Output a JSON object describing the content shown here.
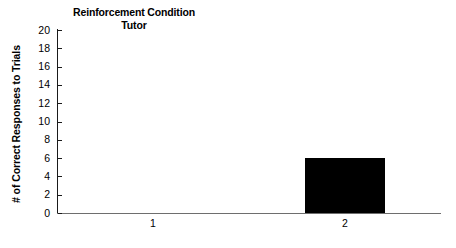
{
  "chart_data": {
    "type": "bar",
    "title": "Reinforcement Condition Tutor",
    "title_lines": [
      "Reinforcement Condition",
      "Tutor"
    ],
    "xlabel": "",
    "ylabel": "# of Correct Responses to Trials",
    "categories": [
      "1",
      "2"
    ],
    "values": [
      0,
      6
    ],
    "series": [
      {
        "name": "Tutor",
        "values": [
          0,
          6
        ]
      }
    ],
    "ylim": [
      0,
      20
    ],
    "ytick_values": [
      20,
      18,
      16,
      14,
      12,
      10,
      8,
      6,
      4,
      2,
      0
    ],
    "ytick_labels": [
      "20",
      "18",
      "16",
      "14",
      "12",
      "10",
      "8",
      "6",
      "4",
      "2",
      "0"
    ],
    "grid": false,
    "legend": false,
    "bar_color": "#000000",
    "axis_color": "#1a1a1a"
  }
}
